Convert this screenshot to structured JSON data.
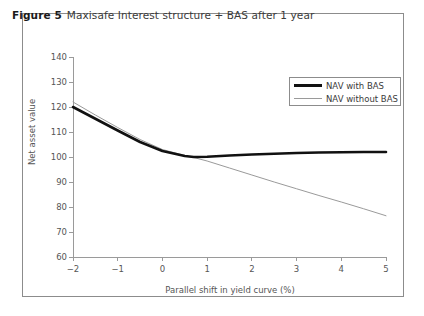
{
  "figure": {
    "label": "Figure 5",
    "caption": "Maxisafe Interest structure + BAS after 1 year"
  },
  "colors": {
    "frame": "#8c8c8c",
    "with_bas_line": "#111111",
    "without_bas_line": "#9a9a9a",
    "axis": "#9a9a9a",
    "text": "#3a3a3a"
  },
  "chart_data": {
    "type": "line",
    "title": "Maxisafe Interest structure + BAS after 1 year",
    "xlabel": "Parallel shift in yield curve (%)",
    "ylabel": "Net asset value",
    "xlim": [
      -2,
      5
    ],
    "ylim": [
      60,
      140
    ],
    "xticks": [
      -2,
      -1,
      0,
      1,
      2,
      3,
      4,
      5
    ],
    "xticklabels": [
      "−2",
      "−1",
      "0",
      "1",
      "2",
      "3",
      "4",
      "5"
    ],
    "yticks": [
      60,
      70,
      80,
      90,
      100,
      110,
      120,
      130,
      140
    ],
    "yticklabels": [
      "60",
      "70",
      "80",
      "90",
      "100",
      "110",
      "120",
      "130",
      "140"
    ],
    "grid": false,
    "legend_position": "upper right",
    "x": [
      -2,
      -1.5,
      -1,
      -0.5,
      0,
      0.5,
      0.7,
      1,
      1.5,
      2,
      2.5,
      3,
      3.5,
      4,
      4.5,
      5
    ],
    "series": [
      {
        "name": "NAV with BAS",
        "color": "#111111",
        "linewidth": 2.6,
        "values": [
          120.0,
          115.3,
          110.6,
          106.0,
          102.4,
          100.4,
          100.0,
          100.1,
          100.6,
          101.0,
          101.3,
          101.6,
          101.8,
          101.9,
          102.0,
          102.0
        ]
      },
      {
        "name": "NAV without BAS",
        "color": "#9a9a9a",
        "linewidth": 1.0,
        "values": [
          122.0,
          116.8,
          111.8,
          107.0,
          103.0,
          100.6,
          99.8,
          98.4,
          95.6,
          92.8,
          90.0,
          87.3,
          84.6,
          82.0,
          79.3,
          76.5
        ]
      }
    ]
  }
}
